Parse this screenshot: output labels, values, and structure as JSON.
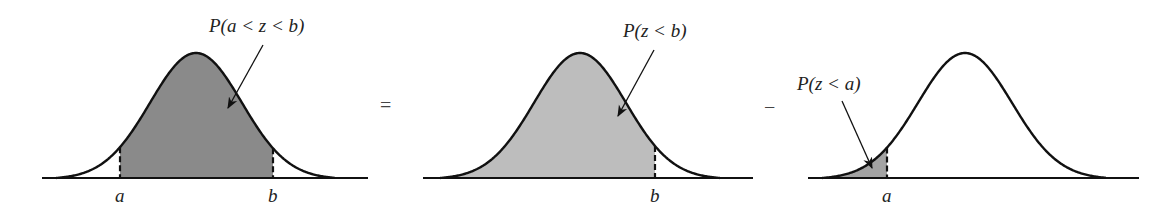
{
  "panels": [
    {
      "id": "between",
      "label": "P(a < z < b)",
      "fill": "#8a8a8a",
      "baseline": [
        42,
        368
      ],
      "curve": {
        "start": 56,
        "end": 335,
        "peak_x": 196
      },
      "shade": [
        120,
        273
      ],
      "cuts": [
        {
          "x": 120,
          "label": "a"
        },
        {
          "x": 273,
          "label": "b"
        }
      ],
      "label_pos": [
        209,
        32
      ],
      "arrow": [
        263,
        45,
        228,
        108
      ]
    },
    {
      "id": "below-b",
      "label": "P(z < b)",
      "fill": "#bdbdbd",
      "baseline": [
        423,
        753
      ],
      "curve": {
        "start": 440,
        "end": 720,
        "peak_x": 580
      },
      "shade": [
        440,
        655
      ],
      "cuts": [
        {
          "x": 655,
          "label": "b"
        }
      ],
      "label_pos": [
        623,
        37
      ],
      "arrow": [
        654,
        50,
        618,
        116
      ]
    },
    {
      "id": "below-a",
      "label": "P(z < a)",
      "fill": "#a3a3a3",
      "baseline": [
        808,
        1139
      ],
      "curve": {
        "start": 822,
        "end": 1106,
        "peak_x": 965
      },
      "shade": [
        822,
        887
      ],
      "cuts": [
        {
          "x": 887,
          "label": "a"
        }
      ],
      "label_pos": [
        797,
        90
      ],
      "arrow": [
        842,
        101,
        872,
        168
      ]
    }
  ],
  "operators": [
    {
      "symbol": "=",
      "x": 380,
      "y": 112
    },
    {
      "symbol": "−",
      "x": 764,
      "y": 114
    }
  ],
  "geometry": {
    "baseline_y": 178,
    "peak_y": 53,
    "label_y": 202
  }
}
